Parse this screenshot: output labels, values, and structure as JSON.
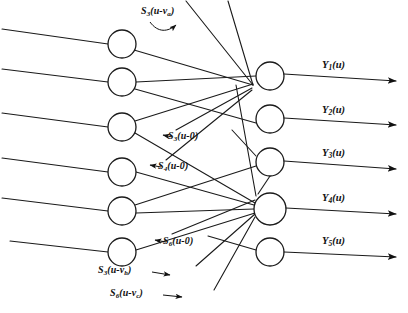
{
  "figure": {
    "width": 408,
    "height": 313,
    "background_color": "#ffffff",
    "stroke_color": "#1a1a1a"
  },
  "hidden_layer": {
    "count": 6,
    "nodes": [
      {
        "id": "h1",
        "cx": 122,
        "cy": 44,
        "r": 14
      },
      {
        "id": "h2",
        "cx": 122,
        "cy": 82,
        "r": 14
      },
      {
        "id": "h3",
        "cx": 122,
        "cy": 127,
        "r": 14
      },
      {
        "id": "h4",
        "cx": 122,
        "cy": 172,
        "r": 14
      },
      {
        "id": "h5",
        "cx": 122,
        "cy": 211,
        "r": 14
      },
      {
        "id": "h6",
        "cx": 122,
        "cy": 252,
        "r": 14
      }
    ]
  },
  "output_layer": {
    "count": 5,
    "nodes": [
      {
        "id": "o1",
        "cx": 270,
        "cy": 76,
        "r": 14
      },
      {
        "id": "o2",
        "cx": 270,
        "cy": 119,
        "r": 14
      },
      {
        "id": "o3",
        "cx": 270,
        "cy": 162,
        "r": 14
      },
      {
        "id": "o4",
        "cx": 270,
        "cy": 209,
        "r": 16
      },
      {
        "id": "o5",
        "cx": 270,
        "cy": 252,
        "r": 14
      }
    ]
  },
  "output_labels": [
    {
      "id": "y1",
      "base": "Y",
      "sub": "1",
      "arg": "(u)",
      "x": 322,
      "y": 60
    },
    {
      "id": "y2",
      "base": "Y",
      "sub": "2",
      "arg": "(u)",
      "x": 322,
      "y": 105
    },
    {
      "id": "y3",
      "base": "Y",
      "sub": "3",
      "arg": "(u)",
      "x": 322,
      "y": 148
    },
    {
      "id": "y4",
      "base": "Y",
      "sub": "4",
      "arg": "(u)",
      "x": 322,
      "y": 193
    },
    {
      "id": "y5",
      "base": "Y",
      "sub": "5",
      "arg": "(u)",
      "x": 322,
      "y": 236
    }
  ],
  "signal_labels": [
    {
      "id": "s3-u-va",
      "base": "S",
      "sub": "3",
      "arg": "(u-v",
      "argsub": "a",
      "tail": ")",
      "x": 141,
      "y": 6
    },
    {
      "id": "s3-u-0",
      "base": "S",
      "sub": "3",
      "arg": "(u-0",
      "argsub": "",
      "tail": ")",
      "x": 168,
      "y": 131
    },
    {
      "id": "s4-u-0",
      "base": "S",
      "sub": "4",
      "arg": "(u-0",
      "argsub": "",
      "tail": ")",
      "x": 158,
      "y": 161
    },
    {
      "id": "s6-u-0",
      "base": "S",
      "sub": "6",
      "arg": "(u-0",
      "argsub": "",
      "tail": ")",
      "x": 163,
      "y": 236
    },
    {
      "id": "s3-u-vb",
      "base": "S",
      "sub": "3",
      "arg": "(u-v",
      "argsub": "b",
      "tail": ")",
      "x": 98,
      "y": 265
    },
    {
      "id": "s6-u-vc",
      "base": "S",
      "sub": "6",
      "arg": "(u-v",
      "argsub": "c",
      "tail": ")",
      "x": 110,
      "y": 288
    }
  ],
  "input_arrows": {
    "description": "six inbound lines entering hidden nodes from the left edge",
    "count": 6
  },
  "output_arrows": {
    "description": "five outbound arrows exiting to the right edge",
    "count": 5
  }
}
